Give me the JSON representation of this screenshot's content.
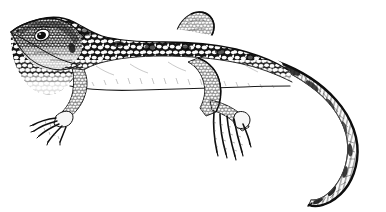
{
  "figure": {
    "kind": "scientific-line-illustration",
    "subject": "lizard",
    "subject_common_name": "lizard",
    "technique": "pen-and-ink stipple and hatching",
    "orientation": "lateral view, facing left",
    "alt_text": "Black and white ink illustration of a lizard in lateral view facing left, with a mottled spotted body, four clawed limbs with splayed toes, and a long tail curving in a broad arc to the right and downward.",
    "canvas": {
      "width": 386,
      "height": 212
    },
    "colors": {
      "background": "#ffffff",
      "ink": "#111111",
      "ink_mid": "#3a3a3a",
      "ink_light": "#777777",
      "scale_fill": "#fcfcfc",
      "shadow_tint": "#d9d9d9"
    },
    "parts": [
      {
        "id": "head",
        "label": "head"
      },
      {
        "id": "eye",
        "label": "eye"
      },
      {
        "id": "snout",
        "label": "snout"
      },
      {
        "id": "neck",
        "label": "neck"
      },
      {
        "id": "body",
        "label": "body"
      },
      {
        "id": "dorsal-pattern",
        "label": "dorsal mottled pattern"
      },
      {
        "id": "belly",
        "label": "belly"
      },
      {
        "id": "forelimb",
        "label": "forelimb"
      },
      {
        "id": "forefoot",
        "label": "forefoot with five toes"
      },
      {
        "id": "hindlimb-upper",
        "label": "upper hind limb"
      },
      {
        "id": "hindlimb",
        "label": "hind limb"
      },
      {
        "id": "hindfoot",
        "label": "hind foot with five long toes"
      },
      {
        "id": "tail",
        "label": "tail"
      },
      {
        "id": "tail-tip",
        "label": "tail tip"
      }
    ]
  }
}
